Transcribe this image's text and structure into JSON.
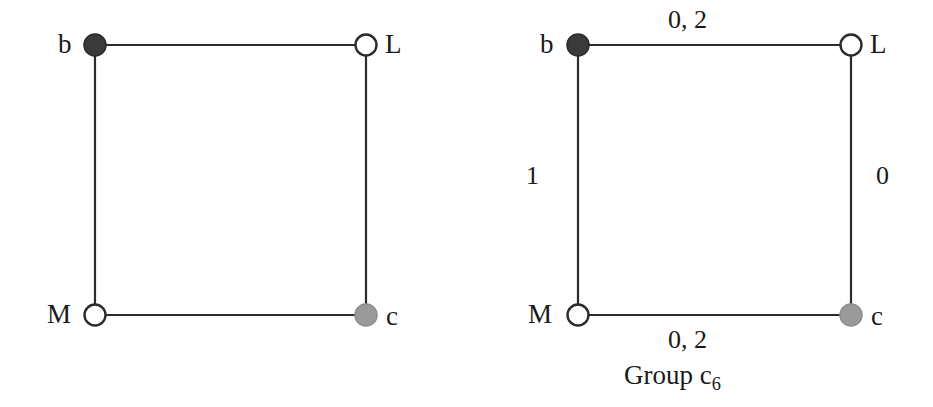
{
  "figure": {
    "background_color": "#ffffff",
    "edge_color": "#2b2b2b",
    "panels": [
      {
        "id": "left",
        "caption": "",
        "nodes": [
          {
            "id": "b",
            "label": "b",
            "style": "filled-dark",
            "fill": "#3a3a3a",
            "stroke": "#2b2b2b",
            "x": 95,
            "y": 45,
            "r": 11,
            "label_side": "left"
          },
          {
            "id": "L",
            "label": "L",
            "style": "open",
            "fill": "#ffffff",
            "stroke": "#2b2b2b",
            "x": 366,
            "y": 45,
            "r": 11,
            "label_side": "right"
          },
          {
            "id": "M",
            "label": "M",
            "style": "open",
            "fill": "#ffffff",
            "stroke": "#2b2b2b",
            "x": 95,
            "y": 315,
            "r": 11,
            "label_side": "left"
          },
          {
            "id": "c",
            "label": "c",
            "style": "filled-gray",
            "fill": "#9a9a9a",
            "stroke": "#8e8e8e",
            "x": 366,
            "y": 315,
            "r": 11,
            "label_side": "right"
          }
        ],
        "edges": [
          {
            "from": "b",
            "to": "L",
            "label": ""
          },
          {
            "from": "b",
            "to": "M",
            "label": ""
          },
          {
            "from": "L",
            "to": "c",
            "label": ""
          },
          {
            "from": "M",
            "to": "c",
            "label": ""
          }
        ]
      },
      {
        "id": "right",
        "caption_text": "Group c",
        "caption_sub": "6",
        "nodes": [
          {
            "id": "b",
            "label": "b",
            "style": "filled-dark",
            "fill": "#3a3a3a",
            "stroke": "#2b2b2b",
            "x": 112,
            "y": 45,
            "r": 11,
            "label_side": "left"
          },
          {
            "id": "L",
            "label": "L",
            "style": "open",
            "fill": "#ffffff",
            "stroke": "#2b2b2b",
            "x": 385,
            "y": 45,
            "r": 11,
            "label_side": "right"
          },
          {
            "id": "M",
            "label": "M",
            "style": "open",
            "fill": "#ffffff",
            "stroke": "#2b2b2b",
            "x": 112,
            "y": 315,
            "r": 11,
            "label_side": "left"
          },
          {
            "id": "c",
            "label": "c",
            "style": "filled-gray",
            "fill": "#9a9a9a",
            "stroke": "#8e8e8e",
            "x": 385,
            "y": 315,
            "r": 11,
            "label_side": "right"
          }
        ],
        "edges": [
          {
            "from": "b",
            "to": "L",
            "label": "0, 2",
            "position": "top"
          },
          {
            "from": "b",
            "to": "M",
            "label": "1",
            "position": "left"
          },
          {
            "from": "L",
            "to": "c",
            "label": "0",
            "position": "right"
          },
          {
            "from": "M",
            "to": "c",
            "label": "0, 2",
            "position": "bottom"
          }
        ]
      }
    ]
  },
  "labels": {
    "left": {
      "node_b": "b",
      "node_L": "L",
      "node_M": "M",
      "node_c": "c"
    },
    "right": {
      "node_b": "b",
      "node_L": "L",
      "node_M": "M",
      "node_c": "c",
      "edge_top": "0, 2",
      "edge_left": "1",
      "edge_right": "0",
      "edge_bottom": "0, 2",
      "caption_text": "Group c",
      "caption_sub": "6"
    }
  }
}
